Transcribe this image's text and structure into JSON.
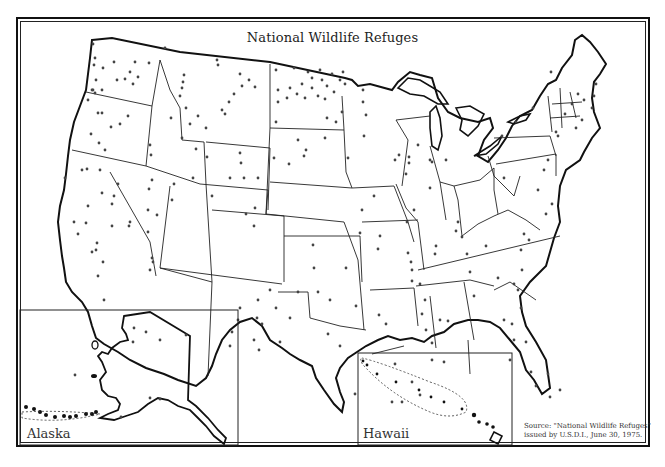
{
  "map": {
    "title": "National Wildlife Refuges",
    "insets": {
      "alaska": {
        "label": "Alaska"
      },
      "hawaii": {
        "label": "Hawaii"
      }
    },
    "source": {
      "line1": "Source: \"National Wildlife Refuges\"",
      "line2": "issued by U.S.D.I., June 30, 1975."
    },
    "legend": {
      "marker": "dot",
      "meaning": "refuge location"
    },
    "colors": {
      "ink": "#111111",
      "background": "#ffffff",
      "dot": "#444444"
    }
  }
}
